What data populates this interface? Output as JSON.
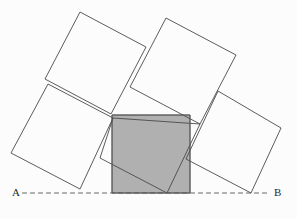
{
  "figure": {
    "background_color": "#fcfcfc",
    "stroke_color": "#4a4a4a",
    "shaded_fill": "#b0b0b0",
    "shaded_stroke": "#5a5a5a",
    "baseline_color": "#5a5a5a",
    "stroke_width": 0.9
  },
  "labels": {
    "a": "A",
    "b": "B"
  },
  "baseline": {
    "name": "line-AB",
    "style": "dashed",
    "x1": 22,
    "y1": 193,
    "x2": 268,
    "y2": 193
  },
  "chart_data": {
    "type": "diagram",
    "xlabel": "",
    "ylabel": "",
    "xlim": [
      0,
      297
    ],
    "ylim": [
      219,
      0
    ],
    "grid": false,
    "legend": null,
    "annotations": [
      {
        "text": "A",
        "x": 17,
        "y": 193,
        "anchor": "right"
      },
      {
        "text": "B",
        "x": 278,
        "y": 193,
        "anchor": "left"
      }
    ],
    "shapes": [
      {
        "name": "square-upper-left",
        "kind": "polygon",
        "fill": "none",
        "stroke": "#4a4a4a",
        "points": [
          [
            80,
            12
          ],
          [
            146,
            47
          ],
          [
            111,
            114
          ],
          [
            45,
            79
          ]
        ]
      },
      {
        "name": "square-upper-right",
        "kind": "polygon",
        "fill": "none",
        "stroke": "#4a4a4a",
        "points": [
          [
            166,
            18
          ],
          [
            236,
            55
          ],
          [
            200,
            124
          ],
          [
            130,
            87
          ]
        ]
      },
      {
        "name": "square-lower-left",
        "kind": "polygon",
        "fill": "none",
        "stroke": "#4a4a4a",
        "points": [
          [
            48,
            84
          ],
          [
            113,
            118
          ],
          [
            80,
            189
          ],
          [
            11,
            153
          ]
        ]
      },
      {
        "name": "square-lower-right",
        "kind": "polygon",
        "fill": "none",
        "stroke": "#4a4a4a",
        "points": [
          [
            218,
            91
          ],
          [
            281,
            128
          ],
          [
            251,
            193
          ],
          [
            186,
            159
          ]
        ]
      },
      {
        "name": "square-tilted-inner",
        "kind": "polygon",
        "fill": "none",
        "stroke": "#4a4a4a",
        "points": [
          [
            113,
            118
          ],
          [
            200,
            124
          ],
          [
            167,
            193
          ],
          [
            100,
            158
          ]
        ]
      },
      {
        "name": "square-shaded-axis-aligned",
        "kind": "polygon",
        "fill": "#b0b0b0",
        "stroke": "#5a5a5a",
        "points": [
          [
            112,
            115
          ],
          [
            190,
            115
          ],
          [
            190,
            193
          ],
          [
            112,
            193
          ]
        ]
      }
    ],
    "lines": [
      {
        "name": "line-AB",
        "x1": 22,
        "y1": 193,
        "x2": 268,
        "y2": 193,
        "stroke": "#5a5a5a",
        "dash": "5,3"
      }
    ]
  }
}
